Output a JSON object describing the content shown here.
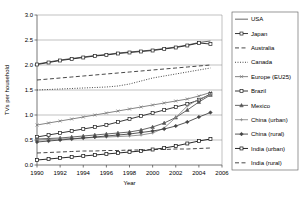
{
  "chart_data": {
    "type": "line",
    "title": "",
    "xlabel": "Year",
    "ylabel": "TVs per household",
    "xlim": [
      1990,
      2006
    ],
    "ylim": [
      0.0,
      3.0
    ],
    "xticks": [
      1990,
      1992,
      1994,
      1996,
      1998,
      2000,
      2002,
      2004,
      2006
    ],
    "yticks": [
      "0.0",
      "0.5",
      "1.0",
      "1.5",
      "2.0",
      "2.5",
      "3.0"
    ],
    "grid": "horizontal",
    "legend_position": "right",
    "x": [
      1990,
      1991,
      1992,
      1993,
      1994,
      1995,
      1996,
      1997,
      1998,
      1999,
      2000,
      2001,
      2002,
      2003,
      2004,
      2005
    ],
    "series": [
      {
        "name": "USA",
        "style": "solid",
        "marker": "none",
        "color": "#555555",
        "values": [
          2.02,
          2.06,
          2.1,
          2.13,
          2.16,
          2.19,
          2.21,
          2.24,
          2.26,
          2.28,
          2.3,
          2.33,
          2.36,
          2.4,
          2.45,
          2.48
        ]
      },
      {
        "name": "Japan",
        "style": "solid",
        "marker": "square",
        "color": "#222222",
        "values": [
          2.01,
          2.05,
          2.09,
          2.12,
          2.15,
          2.18,
          2.2,
          2.23,
          2.25,
          2.27,
          2.29,
          2.32,
          2.35,
          2.39,
          2.44,
          2.42
        ]
      },
      {
        "name": "Australia",
        "style": "dashed",
        "marker": "none",
        "color": "#333333",
        "values": [
          1.7,
          1.72,
          1.74,
          1.76,
          1.78,
          1.8,
          1.82,
          1.84,
          1.86,
          1.88,
          1.9,
          1.92,
          1.94,
          1.96,
          1.98,
          2.0
        ]
      },
      {
        "name": "Canada",
        "style": "dotted",
        "marker": "none",
        "color": "#333333",
        "values": [
          1.5,
          1.51,
          1.52,
          1.53,
          1.54,
          1.55,
          1.56,
          1.58,
          1.62,
          1.68,
          1.74,
          1.78,
          1.82,
          1.86,
          1.9,
          1.94
        ]
      },
      {
        "name": "Europe (EU25)",
        "style": "solid",
        "marker": "cross",
        "color": "#777777",
        "values": [
          0.8,
          0.84,
          0.88,
          0.92,
          0.96,
          1.0,
          1.04,
          1.08,
          1.12,
          1.16,
          1.2,
          1.24,
          1.28,
          1.32,
          1.38,
          1.45
        ]
      },
      {
        "name": "Brazil",
        "style": "solid",
        "marker": "square",
        "color": "#222222",
        "values": [
          0.56,
          0.6,
          0.64,
          0.68,
          0.72,
          0.76,
          0.8,
          0.86,
          0.92,
          0.98,
          1.04,
          1.1,
          1.16,
          1.22,
          1.3,
          1.42
        ]
      },
      {
        "name": "Mexico",
        "style": "solid",
        "marker": "triangle",
        "color": "#555555",
        "values": [
          0.52,
          0.53,
          0.54,
          0.56,
          0.58,
          0.6,
          0.62,
          0.64,
          0.66,
          0.7,
          0.76,
          0.84,
          0.95,
          1.1,
          1.26,
          1.4
        ]
      },
      {
        "name": "China (urban)",
        "style": "solid",
        "marker": "plus",
        "color": "#888888",
        "values": [
          0.5,
          0.51,
          0.52,
          0.53,
          0.54,
          0.55,
          0.56,
          0.57,
          0.58,
          0.6,
          0.64,
          0.74,
          0.95,
          1.18,
          1.32,
          1.4
        ]
      },
      {
        "name": "China (rural)",
        "style": "solid",
        "marker": "diamond",
        "color": "#444444",
        "values": [
          0.46,
          0.48,
          0.5,
          0.52,
          0.54,
          0.56,
          0.58,
          0.6,
          0.62,
          0.65,
          0.68,
          0.72,
          0.78,
          0.86,
          0.96,
          1.05
        ]
      },
      {
        "name": "India (urban)",
        "style": "solid",
        "marker": "square",
        "color": "#111111",
        "values": [
          0.1,
          0.12,
          0.14,
          0.16,
          0.18,
          0.2,
          0.22,
          0.24,
          0.26,
          0.28,
          0.31,
          0.34,
          0.38,
          0.43,
          0.48,
          0.52
        ]
      },
      {
        "name": "India (rural)",
        "style": "dashed",
        "marker": "none",
        "color": "#333333",
        "values": [
          0.24,
          0.25,
          0.26,
          0.27,
          0.28,
          0.28,
          0.29,
          0.29,
          0.3,
          0.3,
          0.31,
          0.31,
          0.32,
          0.32,
          0.33,
          0.34
        ]
      }
    ]
  }
}
